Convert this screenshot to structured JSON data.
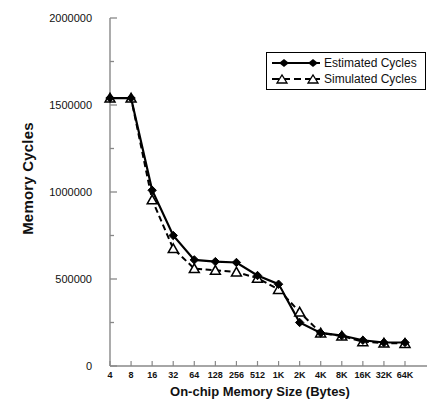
{
  "chart_data": {
    "type": "line",
    "title": "",
    "xlabel": "On-chip Memory Size (Bytes)",
    "ylabel": "Memory Cycles",
    "categories": [
      "4",
      "8",
      "16",
      "32",
      "64",
      "128",
      "256",
      "512",
      "1K",
      "2K",
      "4K",
      "8K",
      "16K",
      "32K",
      "64K"
    ],
    "ylim": [
      0,
      2000000
    ],
    "ytick_labels": [
      "0",
      "500000",
      "1000000",
      "1500000",
      "2000000"
    ],
    "ytick_values": [
      0,
      500000,
      1000000,
      1500000,
      2000000
    ],
    "minor_tick_step": 250000,
    "grid": false,
    "legend_position": "top-right",
    "series": [
      {
        "name": "Estimated Cycles",
        "marker": "filled-diamond",
        "line": "solid",
        "color": "#000000",
        "values": [
          1540000,
          1540000,
          1010000,
          750000,
          610000,
          600000,
          595000,
          520000,
          470000,
          250000,
          190000,
          175000,
          148000,
          135000,
          135000
        ]
      },
      {
        "name": "Simulated Cycles",
        "marker": "open-triangle",
        "line": "dashed",
        "color": "#000000",
        "values": [
          1540000,
          1540000,
          955000,
          675000,
          560000,
          550000,
          540000,
          505000,
          440000,
          310000,
          190000,
          172000,
          140000,
          132000,
          130000
        ]
      }
    ]
  },
  "legend": {
    "items": [
      {
        "label": "Estimated Cycles"
      },
      {
        "label": "Simulated Cycles"
      }
    ]
  }
}
